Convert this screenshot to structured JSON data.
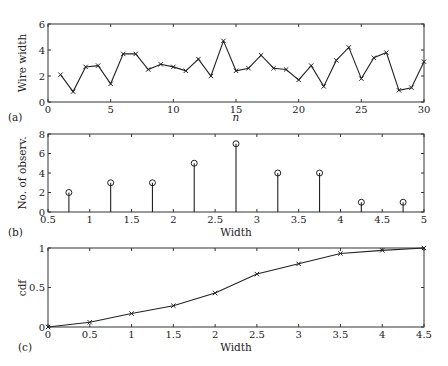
{
  "chart_data": [
    {
      "panel": "(a)",
      "type": "line",
      "title": "",
      "xlabel": "n",
      "ylabel": "Wire width",
      "xlim": [
        0,
        30
      ],
      "ylim": [
        0,
        6
      ],
      "xticks": [
        0,
        5,
        10,
        15,
        20,
        25,
        30
      ],
      "yticks": [
        0,
        2,
        4,
        6
      ],
      "grid": false,
      "marker": "x",
      "x": [
        1,
        2,
        3,
        4,
        5,
        6,
        7,
        8,
        9,
        10,
        11,
        12,
        13,
        14,
        15,
        16,
        17,
        18,
        19,
        20,
        21,
        22,
        23,
        24,
        25,
        26,
        27,
        28,
        29,
        30
      ],
      "values": [
        2.1,
        0.8,
        2.7,
        2.8,
        1.4,
        3.7,
        3.7,
        2.5,
        2.9,
        2.7,
        2.4,
        3.3,
        2.0,
        4.7,
        2.4,
        2.6,
        3.6,
        2.6,
        2.5,
        1.7,
        2.8,
        1.2,
        3.2,
        4.2,
        1.8,
        3.4,
        3.8,
        0.9,
        1.1,
        3.1
      ]
    },
    {
      "panel": "(b)",
      "type": "bar",
      "style": "stem",
      "title": "",
      "xlabel": "Width",
      "ylabel": "No. of observ.",
      "xlim": [
        0.5,
        5
      ],
      "ylim": [
        0,
        8
      ],
      "xticks": [
        0.5,
        1,
        1.5,
        2,
        2.5,
        3,
        3.5,
        4,
        4.5,
        5
      ],
      "yticks": [
        0,
        2,
        4,
        6,
        8
      ],
      "grid": false,
      "marker": "o",
      "x": [
        0.75,
        1.25,
        1.75,
        2.25,
        2.75,
        3.25,
        3.75,
        4.25,
        4.75
      ],
      "values": [
        2,
        3,
        3,
        5,
        7,
        4,
        4,
        1,
        1
      ]
    },
    {
      "panel": "(c)",
      "type": "line",
      "title": "",
      "xlabel": "Width",
      "ylabel": "cdf",
      "xlim": [
        0,
        4.5
      ],
      "ylim": [
        0,
        1
      ],
      "xticks": [
        0,
        0.5,
        1,
        1.5,
        2,
        2.5,
        3,
        3.5,
        4,
        4.5
      ],
      "yticks": [
        0,
        0.5,
        1
      ],
      "grid": false,
      "marker": "x",
      "x": [
        0,
        0.5,
        1,
        1.5,
        2,
        2.5,
        3,
        3.5,
        4,
        4.5
      ],
      "values": [
        0,
        0.06,
        0.17,
        0.27,
        0.43,
        0.67,
        0.8,
        0.93,
        0.97,
        1.0
      ]
    }
  ],
  "panels": {
    "a": {
      "tag": "(a)",
      "xlabel": "n",
      "ylabel": "Wire width"
    },
    "b": {
      "tag": "(b)",
      "xlabel": "Width",
      "ylabel": "No. of observ."
    },
    "c": {
      "tag": "(c)",
      "xlabel": "Width",
      "ylabel": "cdf"
    }
  }
}
